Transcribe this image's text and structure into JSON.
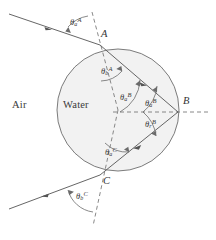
{
  "figure": {
    "media": {
      "outside_label": "Air",
      "inside_label": "Water"
    },
    "points": [
      {
        "id": "A",
        "label": "A",
        "x": 100,
        "y": 45,
        "desc": "entry point of ray on drop surface"
      },
      {
        "id": "B",
        "label": "B",
        "x": 178,
        "y": 112,
        "desc": "internal reflection point on drop surface"
      },
      {
        "id": "C",
        "label": "C",
        "x": 100,
        "y": 175,
        "desc": "exit point of ray on drop surface"
      }
    ],
    "drop": {
      "center_x": 118,
      "center_y": 110,
      "radius": 61,
      "fill_color": "#f2f2f2",
      "stroke_color": "#6d6d6d"
    },
    "colors": {
      "ray": "#555555",
      "normal_dashed": "#6b6b6b",
      "arc": "#6b6b6b",
      "text": "#3a3a3a",
      "background": "#ffffff"
    },
    "angles": [
      {
        "id": "theta-a-A",
        "theta": "θ",
        "sub": "a",
        "sup": "A",
        "x": 72,
        "y": 22,
        "desc": "angle of incidence in air at A"
      },
      {
        "id": "theta-b-A",
        "theta": "θ",
        "sub": "b",
        "sup": "A",
        "x": 103,
        "y": 71,
        "desc": "angle of refraction in water at A"
      },
      {
        "id": "theta-a-B-outer",
        "theta": "θ",
        "sub": "a",
        "sup": "B",
        "x": 122,
        "y": 97,
        "desc": "angle between ray AB and radius to B"
      },
      {
        "id": "theta-a-B-inner",
        "theta": "θ",
        "sub": "a",
        "sup": "B",
        "x": 146,
        "y": 103,
        "desc": "angle of incidence at B on inner surface"
      },
      {
        "id": "theta-r-B",
        "theta": "θ",
        "sub": "r",
        "sup": "B",
        "x": 146,
        "y": 124,
        "desc": "angle of internal reflection at B"
      },
      {
        "id": "theta-a-C",
        "theta": "θ",
        "sub": "a",
        "sup": "C",
        "x": 107,
        "y": 152,
        "desc": "angle of incidence in water at C"
      },
      {
        "id": "theta-b-C",
        "theta": "θ",
        "sub": "b",
        "sup": "C",
        "x": 77,
        "y": 196,
        "desc": "angle of refraction into air at C"
      }
    ],
    "labels": {
      "air": {
        "text": "Air",
        "x": 12,
        "y": 106
      },
      "water": {
        "text": "Water",
        "x": 65,
        "y": 106
      },
      "point_a": {
        "text": "A",
        "x": 102,
        "y": 35
      },
      "point_b": {
        "text": "B",
        "x": 183,
        "y": 101
      },
      "point_c": {
        "text": "C",
        "x": 103,
        "y": 181
      }
    }
  }
}
